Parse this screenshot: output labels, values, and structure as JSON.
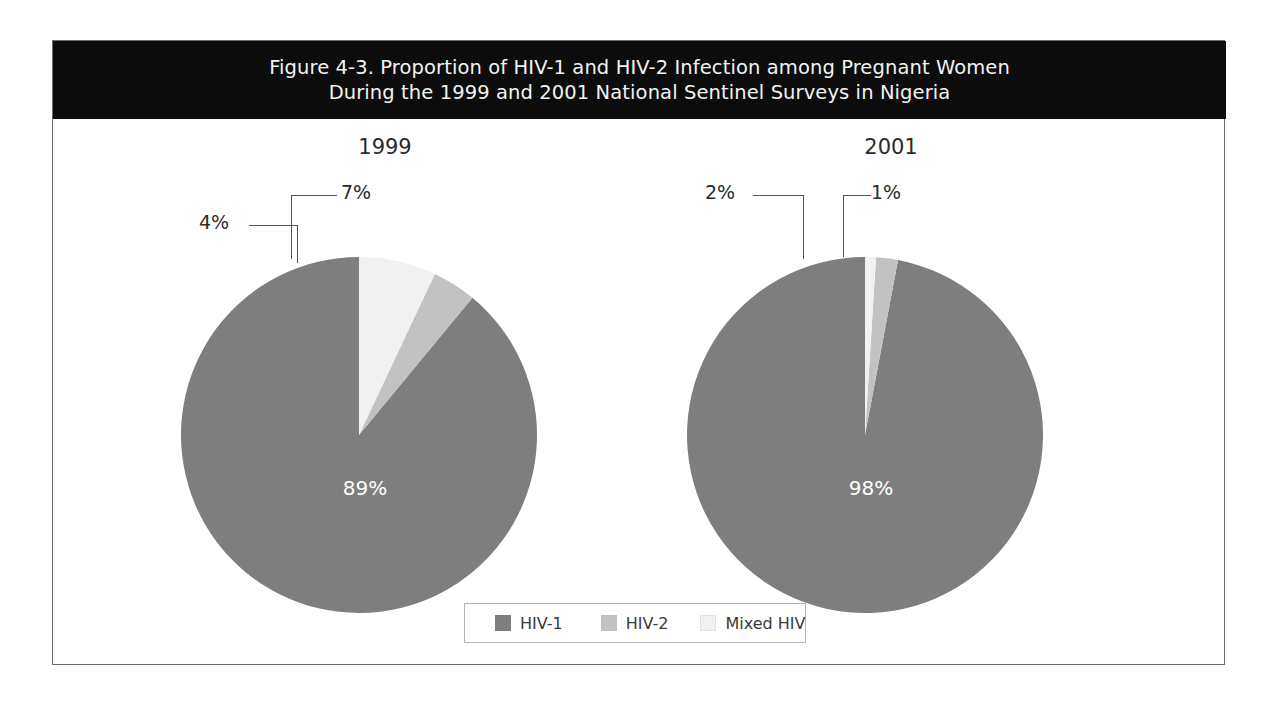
{
  "figure": {
    "title": "Figure 4-3. Proportion of HIV-1 and HIV-2 Infection among Pregnant Women\nDuring the 1999 and 2001 National Sentinel Surveys in Nigeria",
    "background_color": "#ffffff",
    "title_band_color": "#0c0c0c",
    "title_text_color": "#f2f2f2",
    "border_color": "#6e6e6e"
  },
  "legend": {
    "position": "bottom-center",
    "border_color": "#b4b4b4",
    "entries": [
      {
        "label": "HIV-1",
        "color": "#7e7e7e"
      },
      {
        "label": "HIV-2",
        "color": "#c2c2c2"
      },
      {
        "label": "Mixed HIV",
        "color": "#f1f1f1"
      }
    ]
  },
  "panels": [
    {
      "year": "1999",
      "center_label": "89%"
    },
    {
      "year": "2001",
      "center_label": "98%"
    }
  ],
  "callouts": {
    "p1999": [
      {
        "label": "4%",
        "series": "HIV-2"
      },
      {
        "label": "7%",
        "series": "Mixed HIV"
      }
    ],
    "p2001": [
      {
        "label": "2%",
        "series": "HIV-2"
      },
      {
        "label": "1%",
        "series": "Mixed HIV"
      }
    ]
  },
  "chart_data": [
    {
      "type": "pie",
      "title": "1999",
      "categories": [
        "HIV-1",
        "HIV-2",
        "Mixed HIV"
      ],
      "values": [
        89,
        4,
        7
      ],
      "value_labels": [
        "89%",
        "4%",
        "7%"
      ],
      "units": "percent",
      "colors": [
        "#7e7e7e",
        "#c2c2c2",
        "#f1f1f1"
      ],
      "start_angle_deg": 90,
      "direction": "counterclockwise",
      "inside_labels": [
        "89%"
      ],
      "callout_labels": [
        "4%",
        "7%"
      ],
      "legend": true,
      "grid": false
    },
    {
      "type": "pie",
      "title": "2001",
      "categories": [
        "HIV-1",
        "HIV-2",
        "Mixed HIV"
      ],
      "values": [
        98,
        2,
        1
      ],
      "value_labels": [
        "98%",
        "2%",
        "1%"
      ],
      "units": "percent",
      "colors": [
        "#7e7e7e",
        "#c2c2c2",
        "#f1f1f1"
      ],
      "start_angle_deg": 90,
      "direction": "counterclockwise",
      "inside_labels": [
        "98%"
      ],
      "callout_labels": [
        "2%",
        "1%"
      ],
      "legend": true,
      "grid": false
    }
  ]
}
